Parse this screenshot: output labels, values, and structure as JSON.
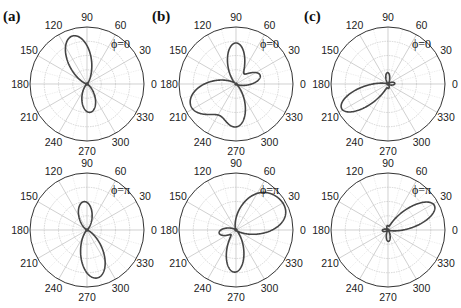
{
  "chart_data": [
    {
      "type": "polar",
      "panel": "(a)",
      "label": "ϕ=0",
      "center": [
        87,
        84
      ],
      "radius": 57,
      "angle_ticks": [
        0,
        30,
        60,
        90,
        120,
        150,
        180,
        210,
        240,
        270,
        300,
        330
      ],
      "rlim": [
        0,
        1
      ],
      "lobes": [
        {
          "angle_deg": 107,
          "r": 0.88,
          "sharp": 6
        },
        {
          "angle_deg": 276,
          "r": 0.5,
          "sharp": 6
        }
      ]
    },
    {
      "type": "polar",
      "panel": "(b)",
      "label": "ϕ=0",
      "center": [
        236,
        84
      ],
      "radius": 57,
      "angle_ticks": [
        0,
        30,
        60,
        90,
        120,
        150,
        180,
        210,
        240,
        270,
        300,
        330
      ],
      "rlim": [
        0,
        1
      ],
      "lobes": [
        {
          "angle_deg": 90,
          "r": 0.72,
          "sharp": 8
        },
        {
          "angle_deg": 20,
          "r": 0.45,
          "sharp": 8
        },
        {
          "angle_deg": 207,
          "r": 0.88,
          "sharp": 4
        },
        {
          "angle_deg": 272,
          "r": 0.72,
          "sharp": 8
        }
      ]
    },
    {
      "type": "polar",
      "panel": "(c)",
      "label": "ϕ=0",
      "center": [
        388,
        84
      ],
      "radius": 57,
      "angle_ticks": [
        0,
        30,
        60,
        90,
        120,
        150,
        180,
        210,
        240,
        270,
        300,
        330
      ],
      "rlim": [
        0,
        1
      ],
      "lobes": [
        {
          "angle_deg": 208,
          "r": 0.92,
          "sharp": 10
        },
        {
          "angle_deg": 92,
          "r": 0.2,
          "sharp": 12
        },
        {
          "angle_deg": 5,
          "r": 0.12,
          "sharp": 8
        },
        {
          "angle_deg": 275,
          "r": 0.08,
          "sharp": 8
        }
      ]
    },
    {
      "type": "polar",
      "panel": "",
      "label": "ϕ=π",
      "center": [
        87,
        230
      ],
      "radius": 57,
      "angle_ticks": [
        0,
        30,
        60,
        90,
        120,
        150,
        180,
        210,
        240,
        270,
        300,
        330
      ],
      "rlim": [
        0,
        1
      ],
      "lobes": [
        {
          "angle_deg": 96,
          "r": 0.5,
          "sharp": 6
        },
        {
          "angle_deg": 282,
          "r": 0.86,
          "sharp": 6
        }
      ]
    },
    {
      "type": "polar",
      "panel": "",
      "label": "ϕ=π",
      "center": [
        236,
        230
      ],
      "radius": 57,
      "angle_ticks": [
        0,
        30,
        60,
        90,
        120,
        150,
        180,
        210,
        240,
        270,
        300,
        330
      ],
      "rlim": [
        0,
        1
      ],
      "lobes": [
        {
          "angle_deg": 50,
          "r": 0.78,
          "sharp": 5
        },
        {
          "angle_deg": 10,
          "r": 0.62,
          "sharp": 8
        },
        {
          "angle_deg": 190,
          "r": 0.3,
          "sharp": 8
        },
        {
          "angle_deg": 268,
          "r": 0.74,
          "sharp": 8
        }
      ]
    },
    {
      "type": "polar",
      "panel": "",
      "label": "ϕ=π",
      "center": [
        388,
        230
      ],
      "radius": 57,
      "angle_ticks": [
        0,
        30,
        60,
        90,
        120,
        150,
        180,
        210,
        240,
        270,
        300,
        330
      ],
      "rlim": [
        0,
        1
      ],
      "lobes": [
        {
          "angle_deg": 28,
          "r": 0.92,
          "sharp": 10
        },
        {
          "angle_deg": 272,
          "r": 0.2,
          "sharp": 12
        },
        {
          "angle_deg": 185,
          "r": 0.1,
          "sharp": 8
        },
        {
          "angle_deg": 95,
          "r": 0.08,
          "sharp": 8
        }
      ]
    }
  ],
  "labels": {
    "panel_a": "(a)",
    "panel_b": "(b)",
    "panel_c": "(c)"
  },
  "colors": {
    "curve": "#444444",
    "outer_ring": "#333333",
    "grid": "#bbbbbb",
    "grid_minor": "#dddddd"
  }
}
